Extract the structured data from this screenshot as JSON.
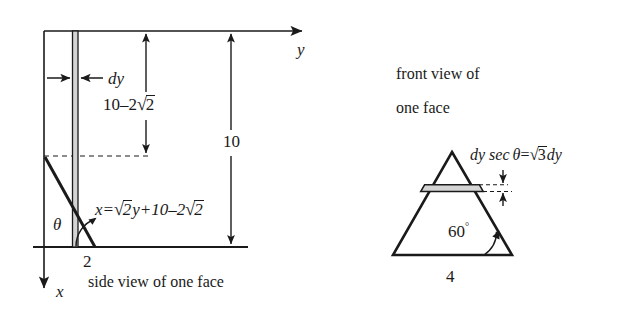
{
  "figure": {
    "background_color": "#ffffff",
    "ink_color": "#1a1a1a",
    "strip_fill_color": "#d9d9d9",
    "width": 621,
    "height": 309
  },
  "left_diagram": {
    "caption": "side view of one face",
    "axis_y_label": "y",
    "axis_x_label": "x",
    "strip_label": "dy",
    "dimension_upper": "10–2√2",
    "dimension_upper_parts": {
      "prefix": "10–2",
      "radicand": "2"
    },
    "dimension_total": "10",
    "angle_label": "θ",
    "base_label": "2",
    "line_equation": "x=√2y+10–2√2",
    "line_equation_parts": {
      "lhs": "x=",
      "root1": "2",
      "mid": "y+10–2",
      "root2": "2"
    }
  },
  "right_diagram": {
    "caption_line1": "front view of",
    "caption_line2": "one face",
    "caption_line1_words": [
      "front",
      "view",
      "of"
    ],
    "caption_line2_words": [
      "one",
      "face"
    ],
    "strip_label": "dy sec θ=√3dy",
    "strip_label_parts": {
      "prefix": "dy",
      "sec": "sec",
      "theta": "θ",
      "equals": "=",
      "radicand": "3",
      "suffix": "dy"
    },
    "angle_label": "60°",
    "angle_value": "60",
    "angle_degree_symbol": "°",
    "base_label": "4"
  },
  "caption_words": {
    "side_view": [
      "side",
      "view",
      "of",
      "one",
      "face"
    ]
  }
}
